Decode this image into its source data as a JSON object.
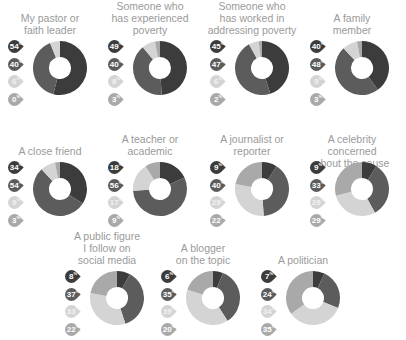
{
  "colors": {
    "s1": "#3c3c3c",
    "s2": "#5c5c5c",
    "s3": "#d4d4d4",
    "s4": "#a9a9a9"
  },
  "chart_data": {
    "type": "pie",
    "subtype": "donut",
    "series_order": [
      "segment 1 (darkest)",
      "segment 2 (dark)",
      "segment 3 (light)",
      "segment 4 (medium)"
    ],
    "charts": [
      {
        "title": "My pastor or faith leader",
        "values": [
          54,
          40,
          6,
          0
        ],
        "labels": [
          "54%",
          "40%",
          "6%",
          "0%"
        ]
      },
      {
        "title": "Someone who has experienced poverty",
        "values": [
          49,
          40,
          8,
          3
        ],
        "labels": [
          "49%",
          "40%",
          "8%",
          "3%"
        ]
      },
      {
        "title": "Someone who has worked in addressing poverty",
        "values": [
          45,
          47,
          6,
          2
        ],
        "labels": [
          "45%",
          "47%",
          "6%",
          "2%"
        ]
      },
      {
        "title": "A family member",
        "values": [
          40,
          48,
          9,
          3
        ],
        "labels": [
          "40%",
          "48%",
          "9%",
          "3%"
        ]
      },
      {
        "title": "A close friend",
        "values": [
          34,
          54,
          9,
          3
        ],
        "labels": [
          "34%",
          "54%",
          "9%",
          "3%"
        ]
      },
      {
        "title": "A teacher or academic",
        "values": [
          18,
          56,
          17,
          9
        ],
        "labels": [
          "18%",
          "56%",
          "17%",
          "9%"
        ]
      },
      {
        "title": "A journalist or reporter",
        "values": [
          9,
          40,
          29,
          22
        ],
        "labels": [
          "9%",
          "40%",
          "29%",
          "22%"
        ]
      },
      {
        "title": "A celebrity concerned about the cause",
        "values": [
          9,
          33,
          29,
          29
        ],
        "labels": [
          "9%",
          "33%",
          "29%",
          "29%"
        ]
      },
      {
        "title": "A public figure I follow on social media",
        "values": [
          8,
          37,
          33,
          22
        ],
        "labels": [
          "8%",
          "37%",
          "33%",
          "22%"
        ]
      },
      {
        "title": "A blogger on the topic",
        "values": [
          6,
          35,
          39,
          20
        ],
        "labels": [
          "6%",
          "35%",
          "39%",
          "20%"
        ]
      },
      {
        "title": "A politician",
        "values": [
          7,
          24,
          34,
          35
        ],
        "labels": [
          "7%",
          "24%",
          "34%",
          "35%"
        ]
      }
    ]
  },
  "panels": [
    {
      "x": 0,
      "y": 12,
      "t1": "My pastor or",
      "t2": "faith leader",
      "t3": "",
      "ty": 12,
      "n": [
        "54",
        "40",
        "6",
        "0"
      ]
    },
    {
      "x": 100,
      "y": 0,
      "t1": "Someone who",
      "t2": "has experienced",
      "t3": "poverty",
      "ty": 0,
      "n": [
        "49",
        "40",
        "8",
        "3"
      ]
    },
    {
      "x": 202,
      "y": 0,
      "t1": "Someone who",
      "t2": "has worked in",
      "t3": "addressing poverty",
      "ty": 0,
      "n": [
        "45",
        "47",
        "6",
        "2"
      ]
    },
    {
      "x": 302,
      "y": 12,
      "t1": "A family",
      "t2": "member",
      "t3": "",
      "ty": 12,
      "n": [
        "40",
        "48",
        "9",
        "3"
      ]
    },
    {
      "x": 0,
      "y": 145,
      "t1": "A close friend",
      "t2": "",
      "t3": "",
      "ty": 145,
      "n": [
        "34",
        "54",
        "9",
        "3"
      ]
    },
    {
      "x": 100,
      "y": 133,
      "t1": "A teacher or",
      "t2": "academic",
      "t3": "",
      "ty": 133,
      "n": [
        "18",
        "56",
        "17",
        "9"
      ]
    },
    {
      "x": 202,
      "y": 133,
      "t1": "A journalist or",
      "t2": "reporter",
      "t3": "",
      "ty": 133,
      "n": [
        "9",
        "40",
        "29",
        "22"
      ]
    },
    {
      "x": 302,
      "y": 133,
      "t1": "A celebrity concerned",
      "t2": "about the cause",
      "t3": "",
      "ty": 133,
      "n": [
        "9",
        "33",
        "29",
        "29"
      ]
    },
    {
      "x": 57,
      "y": 230,
      "t1": "A public figure",
      "t2": "I follow on",
      "t3": "social media",
      "ty": 230,
      "n": [
        "8",
        "37",
        "33",
        "22"
      ]
    },
    {
      "x": 153,
      "y": 242,
      "t1": "A blogger",
      "t2": "on the topic",
      "t3": "",
      "ty": 242,
      "n": [
        "6",
        "35",
        "39",
        "20"
      ]
    },
    {
      "x": 253,
      "y": 254,
      "t1": "A politician",
      "t2": "",
      "t3": "",
      "ty": 254,
      "n": [
        "7",
        "24",
        "34",
        "35"
      ]
    }
  ]
}
